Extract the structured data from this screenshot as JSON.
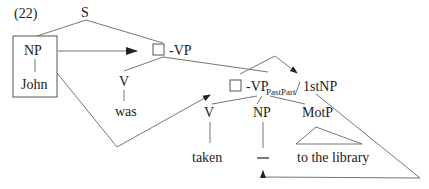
{
  "example_number": "(22)",
  "nodes": {
    "s": "S",
    "np_subject": "NP",
    "john": "John",
    "vp_top": "-VP",
    "v_was": "V",
    "was": "was",
    "vp_pastpart": "-VP",
    "pastpart_sub": "PastPart",
    "first_np": "1stNP",
    "v_taken": "V",
    "taken": "taken",
    "np_gap": "NP",
    "gap": "—",
    "motp": "MotP",
    "to_the_library": "to the library"
  },
  "colors": {
    "text": "#222222",
    "lines": "#666666",
    "background": "#ffffff"
  }
}
